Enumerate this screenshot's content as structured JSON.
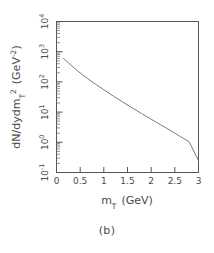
{
  "figure": {
    "caption": "(b)",
    "background_color": "#ffffff",
    "frame_color": "#555555",
    "curve_color": "#7a7a7a",
    "text_color": "#4a4a4a"
  },
  "chart_data": {
    "type": "line",
    "title": "",
    "subtitle": "",
    "xlabel": "m_T  (GeV)",
    "xlabel_parts": {
      "symbol": "m",
      "subscript": "T",
      "units": "(GeV)"
    },
    "ylabel": "dN/dydm_T^2  (GeV^-2)",
    "ylabel_parts": {
      "main": "dN/dydm",
      "subscript": "T",
      "superscript": "2",
      "units_open": "(GeV",
      "units_exp": "−2",
      "units_close": ")"
    },
    "xscale": "linear",
    "yscale": "log",
    "xlim": [
      0,
      3
    ],
    "ylim": [
      0.1,
      10000
    ],
    "grid": false,
    "legend": null,
    "legend_position": "none",
    "xticks": [
      0,
      0.5,
      1,
      1.5,
      2,
      2.5,
      3
    ],
    "xticklabels": [
      "0",
      "0.5",
      "1",
      "1.5",
      "2",
      "2.5",
      "3"
    ],
    "yticks": [
      0.1,
      1,
      10,
      100,
      1000,
      10000
    ],
    "yticklabels": [
      "10⁻¹",
      "10⁰",
      "10¹",
      "10²",
      "10³",
      "10⁴"
    ],
    "ytick_exponents": [
      "-1",
      "0",
      "1",
      "2",
      "3",
      "4"
    ],
    "minor_ticks": "log-decade",
    "tick_direction": "in",
    "series": [
      {
        "name": "mT spectrum",
        "color": "#7a7a7a",
        "linewidth": 1,
        "x": [
          0.15,
          0.25,
          0.35,
          0.45,
          0.55,
          0.65,
          0.75,
          0.85,
          1.0,
          1.2,
          1.4,
          1.6,
          1.8,
          2.0,
          2.2,
          2.4,
          2.6,
          2.8,
          3.0
        ],
        "y": [
          600,
          430,
          310,
          228,
          172,
          132,
          101,
          79,
          55,
          34,
          21.5,
          13.8,
          8.9,
          5.8,
          3.8,
          2.5,
          1.6,
          1.05,
          0.25
        ]
      }
    ]
  }
}
